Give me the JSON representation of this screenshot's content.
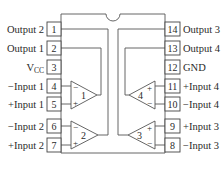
{
  "diagram": {
    "type": "ic-pinout",
    "colors": {
      "line": "#555555",
      "text": "#2a2a2a",
      "background": "#ffffff"
    },
    "left_pins": [
      {
        "num": "1",
        "label": "Output 2"
      },
      {
        "num": "2",
        "label": "Output 1"
      },
      {
        "num": "3",
        "label": "V",
        "label_sub": "CC"
      },
      {
        "num": "4",
        "label": "−Input 1"
      },
      {
        "num": "5",
        "label": "+Input 1"
      },
      {
        "num": "6",
        "label": "−Input 2"
      },
      {
        "num": "7",
        "label": "+Input 2"
      }
    ],
    "right_pins": [
      {
        "num": "14",
        "label": "Output 3"
      },
      {
        "num": "13",
        "label": "Output 4"
      },
      {
        "num": "12",
        "label": "GND"
      },
      {
        "num": "11",
        "label": "+Input 4"
      },
      {
        "num": "10",
        "label": "−Input 4"
      },
      {
        "num": "9",
        "label": "+Input 3"
      },
      {
        "num": "8",
        "label": "−Input 3"
      }
    ],
    "amplifiers": [
      {
        "id": "1",
        "top_sign": "−",
        "bottom_sign": "+"
      },
      {
        "id": "2",
        "top_sign": "−",
        "bottom_sign": "+"
      },
      {
        "id": "4",
        "top_sign": "+",
        "bottom_sign": "−"
      },
      {
        "id": "3",
        "top_sign": "+",
        "bottom_sign": "−"
      }
    ]
  }
}
